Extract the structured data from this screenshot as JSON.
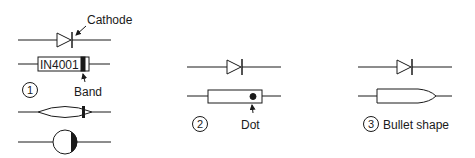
{
  "diagram": {
    "stroke_color": "#1a1a1a",
    "variant1": {
      "number": "1",
      "cathode_label": "Cathode",
      "part_number": "IN4001",
      "band_label": "Band"
    },
    "variant2": {
      "number": "2",
      "dot_label": "Dot"
    },
    "variant3": {
      "number": "3",
      "shape_label": "Bullet shape"
    }
  }
}
